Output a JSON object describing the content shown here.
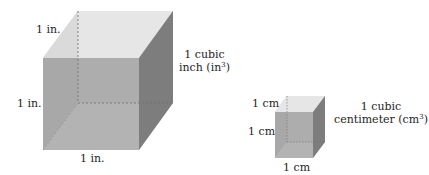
{
  "figure": {
    "cubic_inch": {
      "edge_labels": {
        "top_depth": "1 in.",
        "left_height": "1 in.",
        "bottom_width": "1 in."
      },
      "volume_label": {
        "line1": "1 cubic",
        "line2_prefix": "inch (in",
        "exponent": "3",
        "line2_suffix": ")"
      }
    },
    "cubic_centimeter": {
      "edge_labels": {
        "top_depth": "1 cm",
        "left_height": "1 cm",
        "bottom_width": "1 cm"
      },
      "volume_label": {
        "line1": "1 cubic",
        "line2_prefix": "centimeter (cm",
        "exponent": "3",
        "line2_suffix": ")"
      }
    },
    "colors": {
      "top_face": "#e8e8e8",
      "bottom_face": "#dcdcdc",
      "front_face": "#a9a9a9",
      "left_face": "#b8b8b8",
      "right_face": "#7f7f7f",
      "back_face": "#c6c6c6",
      "hidden_edge": "#7a7a7a"
    }
  }
}
